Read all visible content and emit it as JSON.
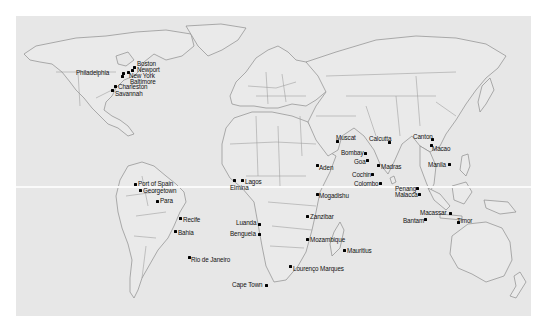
{
  "map": {
    "background": "#e7e7e7",
    "coast_color": "#8c8c8c",
    "equator_y": 170,
    "cities": [
      {
        "name": "Boston",
        "dot": [
          119,
          51
        ],
        "label": [
          121,
          44
        ],
        "anchor": "left"
      },
      {
        "name": "Newport",
        "dot": [
          117,
          53
        ],
        "label": [
          122,
          49
        ],
        "anchor": "left"
      },
      {
        "name": "Philadelphia",
        "dot": [
          109,
          57
        ],
        "label": [
          60,
          52
        ],
        "anchor": "left"
      },
      {
        "name": "New York",
        "dot": [
          113,
          55
        ],
        "label": [
          113,
          55
        ],
        "anchor": "left"
      },
      {
        "name": "Baltimore",
        "dot": [
          107,
          60
        ],
        "label": [
          115,
          61
        ],
        "anchor": "left"
      },
      {
        "name": "Charleston",
        "dot": [
          99,
          70
        ],
        "label": [
          102,
          67
        ],
        "anchor": "left"
      },
      {
        "name": "Savannah",
        "dot": [
          96,
          74
        ],
        "label": [
          99,
          73
        ],
        "anchor": "left"
      },
      {
        "name": "Port of Spain",
        "dot": [
          121,
          168
        ],
        "label": [
          124,
          164
        ],
        "anchor": "left"
      },
      {
        "name": "Georgetown",
        "dot": [
          126,
          173
        ],
        "label": [
          129,
          171
        ],
        "anchor": "left"
      },
      {
        "name": "Para",
        "dot": [
          141,
          184
        ],
        "label": [
          144,
          181
        ],
        "anchor": "left"
      },
      {
        "name": "Recife",
        "dot": [
          163,
          202
        ],
        "label": [
          167,
          199
        ],
        "anchor": "left"
      },
      {
        "name": "Bahia",
        "dot": [
          158,
          215
        ],
        "label": [
          162,
          213
        ],
        "anchor": "left"
      },
      {
        "name": "Rio de Janeiro",
        "dot": [
          172,
          241
        ],
        "label": [
          186,
          240
        ],
        "anchor": "left"
      },
      {
        "name": "Lagos",
        "dot": [
          237,
          166
        ],
        "label": [
          240,
          162
        ],
        "anchor": "left"
      },
      {
        "name": "Elmina",
        "dot": [
          229,
          167
        ],
        "label": [
          226,
          171
        ],
        "anchor": "left"
      },
      {
        "name": "Luanda",
        "dot": [
          258,
          208
        ],
        "label": [
          237,
          203
        ],
        "anchor": "left"
      },
      {
        "name": "Benguela",
        "dot": [
          258,
          219
        ],
        "label": [
          231,
          213
        ],
        "anchor": "left"
      },
      {
        "name": "Cape Town",
        "dot": [
          265,
          269
        ],
        "label": [
          232,
          264
        ],
        "anchor": "left"
      },
      {
        "name": "Lourenço Marques",
        "dot": [
          290,
          250
        ],
        "label": [
          293,
          248
        ],
        "anchor": "left"
      },
      {
        "name": "Mozambique",
        "dot": [
          306,
          223
        ],
        "label": [
          309,
          220
        ],
        "anchor": "left"
      },
      {
        "name": "Mauritius",
        "dot": [
          343,
          234
        ],
        "label": [
          347,
          231
        ],
        "anchor": "left"
      },
      {
        "name": "Zanzibar",
        "dot": [
          306,
          200
        ],
        "label": [
          309,
          197
        ],
        "anchor": "left"
      },
      {
        "name": "Mogadishu",
        "dot": [
          316,
          178
        ],
        "label": [
          319,
          177
        ],
        "anchor": "left"
      },
      {
        "name": "Aden",
        "dot": [
          316,
          149
        ],
        "label": [
          319,
          148
        ],
        "anchor": "left"
      },
      {
        "name": "Muscat",
        "dot": [
          338,
          125
        ],
        "label": [
          335,
          118
        ],
        "anchor": "left"
      },
      {
        "name": "Bombay",
        "dot": [
          364,
          137
        ],
        "label": [
          341,
          133
        ],
        "anchor": "left"
      },
      {
        "name": "Goa",
        "dot": [
          367,
          144
        ],
        "label": [
          354,
          142
        ],
        "anchor": "left"
      },
      {
        "name": "Cochin",
        "dot": [
          371,
          157
        ],
        "label": [
          351,
          155
        ],
        "anchor": "left"
      },
      {
        "name": "Colombo",
        "dot": [
          380,
          167
        ],
        "label": [
          354,
          164
        ],
        "anchor": "left"
      },
      {
        "name": "Madras",
        "dot": [
          378,
          148
        ],
        "label": [
          380,
          147
        ],
        "anchor": "left"
      },
      {
        "name": "Calcutta",
        "dot": [
          389,
          126
        ],
        "label": [
          369,
          119
        ],
        "anchor": "left"
      },
      {
        "name": "Penang",
        "dot": [
          417,
          172
        ],
        "label": [
          395,
          169
        ],
        "anchor": "left"
      },
      {
        "name": "Malacca",
        "dot": [
          420,
          178
        ],
        "label": [
          396,
          175
        ],
        "anchor": "left"
      },
      {
        "name": "Canton",
        "dot": [
          432,
          123
        ],
        "label": [
          413,
          117
        ],
        "anchor": "left"
      },
      {
        "name": "Macao",
        "dot": [
          433,
          130
        ],
        "label": [
          432,
          129
        ],
        "anchor": "left"
      },
      {
        "name": "Manila",
        "dot": [
          449,
          148
        ],
        "label": [
          428,
          145
        ],
        "anchor": "left"
      },
      {
        "name": "Bantam",
        "dot": [
          425,
          203
        ],
        "label": [
          403,
          200
        ],
        "anchor": "left"
      },
      {
        "name": "Macassar",
        "dot": [
          450,
          197
        ],
        "label": [
          421,
          193
        ],
        "anchor": "left"
      },
      {
        "name": "Timor",
        "dot": [
          457,
          205
        ],
        "label": [
          456,
          201
        ],
        "anchor": "left"
      }
    ]
  }
}
